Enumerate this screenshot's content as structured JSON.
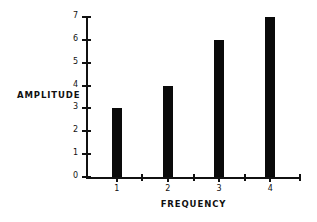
{
  "chart_data": {
    "type": "bar",
    "title": "",
    "subtitle": "",
    "xlabel": "FREQUENCY",
    "ylabel": "AMPLITUDE",
    "categories": [
      "1",
      "2",
      "3",
      "4"
    ],
    "values": [
      3,
      4,
      6,
      7
    ],
    "series": [
      {
        "name": "",
        "values": [
          3,
          4,
          6,
          7
        ]
      }
    ],
    "ylim": [
      0,
      7
    ],
    "xlim": [
      0.4,
      4.6
    ],
    "y_ticks": [
      "0",
      "1",
      "2",
      "3",
      "4",
      "5",
      "6",
      "7"
    ],
    "y_tick_values": [
      0,
      1,
      2,
      3,
      4,
      5,
      6,
      7
    ],
    "x_ticks": [
      "1",
      "2",
      "3",
      "4"
    ],
    "x_minor_ticks": [
      1.5,
      2.5,
      3.5
    ],
    "grid": false,
    "legend": null,
    "annotations": [],
    "bar_color": "#0a0a0a",
    "axis_color": "#111111",
    "background_color": "#ffffff"
  }
}
